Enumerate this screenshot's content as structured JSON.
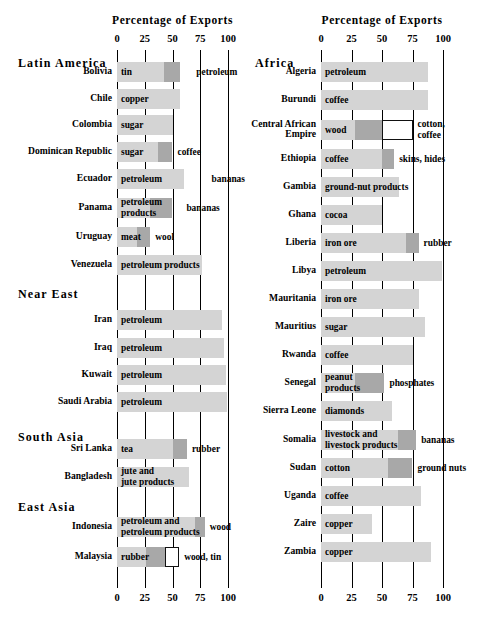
{
  "chart_data": {
    "type": "bar",
    "title": "Percentage of Exports",
    "xlabel": "Percentage of Exports",
    "ylabel": "",
    "xlim": [
      0,
      100
    ],
    "ticks": [
      0,
      25,
      50,
      75,
      100
    ],
    "grid": true,
    "legend": "none",
    "orientation": "horizontal-stacked",
    "panels": [
      {
        "id": "left",
        "axis_title": "Percentage of Exports",
        "tick_labels": [
          "0",
          "25",
          "50",
          "75",
          "100"
        ],
        "groups": [
          {
            "heading": "Latin America",
            "rows": [
              {
                "label": "Bolivia",
                "segments": [
                  {
                    "shade": "light",
                    "start": 0,
                    "end": 42,
                    "label": "tin",
                    "label_pos": "inside"
                  },
                  {
                    "shade": "dark",
                    "start": 42,
                    "end": 57,
                    "label": "petroleum",
                    "label_pos": "outside"
                  }
                ],
                "total": 67
              },
              {
                "label": "Chile",
                "segments": [
                  {
                    "shade": "light",
                    "start": 0,
                    "end": 57,
                    "label": "copper",
                    "label_pos": "inside"
                  }
                ],
                "total": 57
              },
              {
                "label": "Colombia",
                "segments": [
                  {
                    "shade": "light",
                    "start": 0,
                    "end": 50,
                    "label": "sugar",
                    "label_pos": "inside"
                  }
                ],
                "total": 50
              },
              {
                "label": "Dominican Republic",
                "segments": [
                  {
                    "shade": "light",
                    "start": 0,
                    "end": 37,
                    "label": "sugar",
                    "label_pos": "inside"
                  },
                  {
                    "shade": "dark",
                    "start": 37,
                    "end": 50,
                    "label": "coffee",
                    "label_pos": "outside"
                  }
                ],
                "total": 50
              },
              {
                "label": "Ecuador",
                "segments": [
                  {
                    "shade": "light",
                    "start": 0,
                    "end": 60,
                    "label": "petroleum",
                    "label_pos": "inside"
                  }
                ],
                "total": 60,
                "far_label": "bananas"
              },
              {
                "label": "Panama",
                "segments": [
                  {
                    "shade": "light",
                    "start": 0,
                    "end": 30,
                    "label": "petroleum products",
                    "label_pos": "inside"
                  },
                  {
                    "shade": "dark",
                    "start": 30,
                    "end": 50,
                    "label": "bananas",
                    "label_pos": "outside"
                  }
                ],
                "total": 58
              },
              {
                "label": "Uruguay",
                "segments": [
                  {
                    "shade": "light",
                    "start": 0,
                    "end": 18,
                    "label": "meat",
                    "label_pos": "inside"
                  },
                  {
                    "shade": "dark",
                    "start": 18,
                    "end": 30,
                    "label": "wool",
                    "label_pos": "outside"
                  }
                ],
                "total": 30
              },
              {
                "label": "Venezuela",
                "segments": [
                  {
                    "shade": "light",
                    "start": 0,
                    "end": 77,
                    "label": "petroleum products",
                    "label_pos": "inside"
                  }
                ],
                "total": 77
              }
            ]
          },
          {
            "heading": "Near East",
            "rows": [
              {
                "label": "Iran",
                "segments": [
                  {
                    "shade": "light",
                    "start": 0,
                    "end": 95,
                    "label": "petroleum",
                    "label_pos": "inside"
                  }
                ],
                "total": 95
              },
              {
                "label": "Iraq",
                "segments": [
                  {
                    "shade": "light",
                    "start": 0,
                    "end": 96,
                    "label": "petroleum",
                    "label_pos": "inside"
                  }
                ],
                "total": 96
              },
              {
                "label": "Kuwait",
                "segments": [
                  {
                    "shade": "light",
                    "start": 0,
                    "end": 98,
                    "label": "petroleum",
                    "label_pos": "inside"
                  }
                ],
                "total": 98
              },
              {
                "label": "Saudi Arabia",
                "segments": [
                  {
                    "shade": "light",
                    "start": 0,
                    "end": 99,
                    "label": "petroleum",
                    "label_pos": "inside"
                  }
                ],
                "total": 99
              }
            ]
          },
          {
            "heading": "South Asia",
            "rows": [
              {
                "label": "Sri Lanka",
                "segments": [
                  {
                    "shade": "light",
                    "start": 0,
                    "end": 50,
                    "label": "tea",
                    "label_pos": "inside"
                  },
                  {
                    "shade": "dark",
                    "start": 50,
                    "end": 63,
                    "label": "rubber",
                    "label_pos": "outside"
                  }
                ],
                "total": 63
              },
              {
                "label": "Bangladesh",
                "segments": [
                  {
                    "shade": "light",
                    "start": 0,
                    "end": 65,
                    "label": "jute and jute products",
                    "label_pos": "inside"
                  }
                ],
                "total": 65
              }
            ]
          },
          {
            "heading": "East Asia",
            "rows": [
              {
                "label": "Indonesia",
                "segments": [
                  {
                    "shade": "light",
                    "start": 0,
                    "end": 70,
                    "label": "petroleum and petroleum products",
                    "label_pos": "inside"
                  },
                  {
                    "shade": "dark",
                    "start": 70,
                    "end": 79,
                    "label": "wood",
                    "label_pos": "outside"
                  }
                ],
                "total": 79
              },
              {
                "label": "Malaysia",
                "segments": [
                  {
                    "shade": "light",
                    "start": 0,
                    "end": 26,
                    "label": "rubber",
                    "label_pos": "inside"
                  },
                  {
                    "shade": "dark",
                    "start": 26,
                    "end": 43,
                    "label": "",
                    "label_pos": "none"
                  },
                  {
                    "shade": "open",
                    "start": 43,
                    "end": 56,
                    "label": "wood, tin",
                    "label_pos": "outside"
                  }
                ],
                "total": 56
              }
            ]
          }
        ]
      },
      {
        "id": "right",
        "axis_title": "Percentage of Exports",
        "tick_labels": [
          "0",
          "25",
          "50",
          "75",
          "100"
        ],
        "groups": [
          {
            "heading": "Africa",
            "rows": [
              {
                "label": "Algeria",
                "segments": [
                  {
                    "shade": "light",
                    "start": 0,
                    "end": 88,
                    "label": "petroleum",
                    "label_pos": "inside"
                  }
                ],
                "total": 88
              },
              {
                "label": "Burundi",
                "segments": [
                  {
                    "shade": "light",
                    "start": 0,
                    "end": 88,
                    "label": "coffee",
                    "label_pos": "inside"
                  }
                ],
                "total": 88
              },
              {
                "label": "Central African Empire",
                "segments": [
                  {
                    "shade": "light",
                    "start": 0,
                    "end": 28,
                    "label": "wood",
                    "label_pos": "inside"
                  },
                  {
                    "shade": "dark",
                    "start": 28,
                    "end": 50,
                    "label": "",
                    "label_pos": "none"
                  },
                  {
                    "shade": "open",
                    "start": 50,
                    "end": 75,
                    "label": "cotton, coffee",
                    "label_pos": "outside"
                  }
                ],
                "total": 75
              },
              {
                "label": "Ethiopia",
                "segments": [
                  {
                    "shade": "light",
                    "start": 0,
                    "end": 50,
                    "label": "coffee",
                    "label_pos": "inside"
                  },
                  {
                    "shade": "dark",
                    "start": 50,
                    "end": 60,
                    "label": "skins, hides",
                    "label_pos": "outside"
                  }
                ],
                "total": 60
              },
              {
                "label": "Gambia",
                "segments": [
                  {
                    "shade": "light",
                    "start": 0,
                    "end": 64,
                    "label": "ground-nut products",
                    "label_pos": "inside"
                  }
                ],
                "total": 64
              },
              {
                "label": "Ghana",
                "segments": [
                  {
                    "shade": "light",
                    "start": 0,
                    "end": 50,
                    "label": "cocoa",
                    "label_pos": "inside"
                  }
                ],
                "total": 50
              },
              {
                "label": "Liberia",
                "segments": [
                  {
                    "shade": "light",
                    "start": 0,
                    "end": 70,
                    "label": "iron ore",
                    "label_pos": "inside"
                  },
                  {
                    "shade": "dark",
                    "start": 70,
                    "end": 80,
                    "label": "rubber",
                    "label_pos": "outside"
                  }
                ],
                "total": 80
              },
              {
                "label": "Libya",
                "segments": [
                  {
                    "shade": "light",
                    "start": 0,
                    "end": 99,
                    "label": "petroleum",
                    "label_pos": "inside"
                  }
                ],
                "total": 99
              },
              {
                "label": "Mauritania",
                "segments": [
                  {
                    "shade": "light",
                    "start": 0,
                    "end": 80,
                    "label": "iron ore",
                    "label_pos": "inside"
                  }
                ],
                "total": 80
              },
              {
                "label": "Mauritius",
                "segments": [
                  {
                    "shade": "light",
                    "start": 0,
                    "end": 85,
                    "label": "sugar",
                    "label_pos": "inside"
                  }
                ],
                "total": 85
              },
              {
                "label": "Rwanda",
                "segments": [
                  {
                    "shade": "light",
                    "start": 0,
                    "end": 75,
                    "label": "coffee",
                    "label_pos": "inside"
                  }
                ],
                "total": 75
              },
              {
                "label": "Senegal",
                "segments": [
                  {
                    "shade": "light",
                    "start": 0,
                    "end": 28,
                    "label": "peanut products",
                    "label_pos": "inside"
                  },
                  {
                    "shade": "dark",
                    "start": 28,
                    "end": 52,
                    "label": "phosphates",
                    "label_pos": "outside"
                  }
                ],
                "total": 52
              },
              {
                "label": "Sierra Leone",
                "segments": [
                  {
                    "shade": "light",
                    "start": 0,
                    "end": 58,
                    "label": "diamonds",
                    "label_pos": "inside"
                  }
                ],
                "total": 58
              },
              {
                "label": "Somalia",
                "segments": [
                  {
                    "shade": "light",
                    "start": 0,
                    "end": 63,
                    "label": "livestock and livestock products",
                    "label_pos": "inside"
                  },
                  {
                    "shade": "dark",
                    "start": 63,
                    "end": 78,
                    "label": "bananas",
                    "label_pos": "outside"
                  }
                ],
                "total": 78
              },
              {
                "label": "Sudan",
                "segments": [
                  {
                    "shade": "light",
                    "start": 0,
                    "end": 55,
                    "label": "cotton",
                    "label_pos": "inside"
                  },
                  {
                    "shade": "dark",
                    "start": 55,
                    "end": 75,
                    "label": "ground nuts",
                    "label_pos": "outside"
                  }
                ],
                "total": 75
              },
              {
                "label": "Uganda",
                "segments": [
                  {
                    "shade": "light",
                    "start": 0,
                    "end": 82,
                    "label": "coffee",
                    "label_pos": "inside"
                  }
                ],
                "total": 82
              },
              {
                "label": "Zaire",
                "segments": [
                  {
                    "shade": "light",
                    "start": 0,
                    "end": 42,
                    "label": "copper",
                    "label_pos": "inside"
                  }
                ],
                "total": 42
              },
              {
                "label": "Zambia",
                "segments": [
                  {
                    "shade": "light",
                    "start": 0,
                    "end": 90,
                    "label": "copper",
                    "label_pos": "inside"
                  }
                ],
                "total": 90
              }
            ]
          }
        ]
      }
    ]
  },
  "colors": {
    "light_segment": "#d4d4d4",
    "dark_segment": "#a8a8a8",
    "open_segment": "#ffffff",
    "axis": "#000000",
    "text": "#000000"
  }
}
